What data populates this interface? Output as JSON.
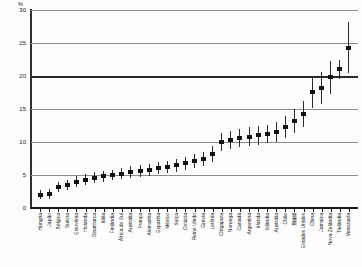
{
  "chart_data": {
    "type": "scatter",
    "title": "",
    "subtitle": "",
    "xlabel": "",
    "ylabel": "%",
    "ylim": [
      0,
      30
    ],
    "yticks": [
      30,
      25,
      20,
      15,
      10,
      5,
      0
    ],
    "ytick_labels": [
      "30",
      "25",
      "20",
      "15",
      "10",
      "5",
      "0"
    ],
    "grid": true,
    "emphasis_gridline": 20,
    "legend": "none",
    "marker_style": "filled-square-with-error-bars",
    "categories": [
      "Hungria",
      "Japão",
      "Bélgica",
      "Suécia",
      "Eslovênia",
      "Holanda",
      "Dinamarca",
      "Itália",
      "Finlândia",
      "África do Sul",
      "Austrália",
      "França",
      "Alemanha",
      "Espanha",
      "México",
      "Suíça",
      "Croácia",
      "Reino Unido",
      "Grécia",
      "Letônia",
      "Cingapura",
      "Noruega",
      "Canadá",
      "Argentina",
      "Irlanda",
      "Islândia",
      "Austrália",
      "Chile",
      "Brasil",
      "Estados Unidos",
      "China",
      "Jamaica",
      "Nova Zelândia",
      "Tailândia",
      "Venezuela"
    ],
    "values": [
      2.0,
      2.1,
      3.2,
      3.5,
      4.0,
      4.3,
      4.6,
      4.8,
      5.0,
      5.2,
      5.4,
      5.6,
      5.8,
      6.0,
      6.2,
      6.5,
      6.8,
      7.1,
      7.4,
      8.2,
      10.0,
      10.3,
      10.6,
      10.8,
      11.0,
      11.2,
      11.5,
      12.3,
      13.2,
      14.2,
      17.6,
      18.2,
      19.8,
      21.0,
      24.3
    ],
    "error_low": [
      1.3,
      1.4,
      2.4,
      2.7,
      3.2,
      3.5,
      3.8,
      4.0,
      4.2,
      4.4,
      4.5,
      4.7,
      4.9,
      5.1,
      5.3,
      5.5,
      5.8,
      6.0,
      6.3,
      7.0,
      8.6,
      9.0,
      9.2,
      9.4,
      9.6,
      9.8,
      10.0,
      10.6,
      11.4,
      12.2,
      15.2,
      15.8,
      17.3,
      19.6,
      20.4
    ],
    "error_high": [
      2.8,
      2.9,
      4.0,
      4.3,
      4.8,
      5.1,
      5.4,
      5.6,
      5.8,
      6.0,
      6.3,
      6.5,
      6.7,
      6.9,
      7.1,
      7.5,
      7.8,
      8.2,
      8.5,
      9.4,
      11.4,
      11.6,
      12.0,
      12.2,
      12.4,
      12.6,
      13.0,
      14.0,
      15.0,
      16.2,
      20.0,
      20.6,
      22.3,
      22.4,
      28.2
    ],
    "highlighted_category": "Brasil"
  },
  "axis": {
    "percent_symbol": "%"
  },
  "footer": {
    "caption": ""
  }
}
